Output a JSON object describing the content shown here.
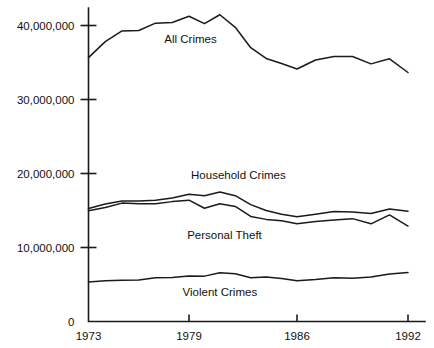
{
  "chart_data": {
    "type": "line",
    "title": "",
    "subtitle": "",
    "xlabel": "",
    "ylabel": "",
    "xlim": [
      1973,
      1992
    ],
    "ylim": [
      0,
      44000000
    ],
    "grid": false,
    "legend": "inline-labels",
    "x": [
      1973,
      1974,
      1975,
      1976,
      1977,
      1978,
      1979,
      1980,
      1981,
      1982,
      1983,
      1984,
      1985,
      1986,
      1987,
      1988,
      1989,
      1990,
      1991,
      1992
    ],
    "x_ticks": [
      1973,
      1979,
      1986,
      1992
    ],
    "x_tick_labels": [
      "1973",
      "1979",
      "1986",
      "1992"
    ],
    "y_ticks": [
      0,
      10000000,
      20000000,
      30000000,
      40000000
    ],
    "y_tick_labels": [
      "0",
      "10,000,000",
      "20,000,000",
      "30,000,000",
      "40,000,000"
    ],
    "series": [
      {
        "name": "All Crimes",
        "label": "All Crimes",
        "color": "#1a1a1a",
        "label_x": 1979.1,
        "label_y": 37600000,
        "values": [
          35661000,
          37823000,
          39266000,
          39318000,
          40314000,
          40412000,
          41249000,
          40252000,
          41454000,
          39756000,
          37001000,
          35544000,
          34864000,
          34118000,
          35336000,
          35800000,
          35818000,
          34818000,
          35497000,
          33649000
        ]
      },
      {
        "name": "Household Crimes",
        "label": "Household Crimes",
        "color": "#1a1a1a",
        "label_x": 1982.2,
        "label_y": 19200000,
        "values": [
          15260000,
          15889000,
          16294000,
          16300000,
          16400000,
          16700000,
          17200000,
          17000000,
          17500000,
          17000000,
          15800000,
          15000000,
          14500000,
          14150000,
          14500000,
          14850000,
          14800000,
          14600000,
          15200000,
          14900000
        ]
      },
      {
        "name": "Personal Theft",
        "label": "Personal Theft",
        "color": "#1a1a1a",
        "label_x": 1981.3,
        "label_y": 11100000,
        "values": [
          14970000,
          15400000,
          16000000,
          15900000,
          15900000,
          16200000,
          16400000,
          15300000,
          15900000,
          15550000,
          14200000,
          13800000,
          13600000,
          13200000,
          13500000,
          13700000,
          13900000,
          13200000,
          14400000,
          12900000
        ]
      },
      {
        "name": "Violent Crimes",
        "label": "Violent Crimes",
        "color": "#1a1a1a",
        "label_x": 1981.0,
        "label_y": 3500000,
        "values": [
          5350000,
          5510000,
          5570000,
          5600000,
          5900000,
          5940000,
          6160000,
          6130000,
          6580000,
          6460000,
          5900000,
          6020000,
          5820000,
          5520000,
          5660000,
          5910000,
          5860000,
          6010000,
          6420000,
          6620000
        ]
      }
    ]
  }
}
